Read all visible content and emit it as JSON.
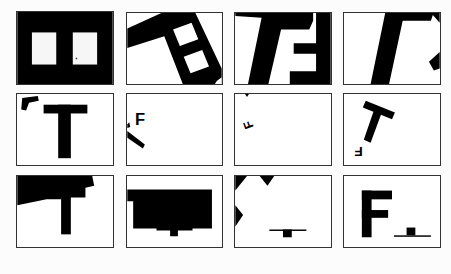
{
  "figure": {
    "layout": {
      "rows": 3,
      "cols": 4
    },
    "colors": {
      "ink": "#000000",
      "paper": "#ffffff",
      "border": "#333333"
    },
    "panels": [
      {
        "id": "r1c1",
        "description": "black field with two white square windows"
      },
      {
        "id": "r1c2",
        "description": "rotated black frame with two white squares"
      },
      {
        "id": "r1c3",
        "description": "slanted T merged with E-like shape"
      },
      {
        "id": "r1c4",
        "description": "slanted bar with partial shapes at right edge"
      },
      {
        "id": "r2c1",
        "description": "large T with small rotated F-fragment at top-left",
        "letters": [
          "T"
        ]
      },
      {
        "id": "r2c2",
        "description": "small F with diagonal bar at left edge",
        "letters": [
          "F"
        ]
      },
      {
        "id": "r2c3",
        "description": "small rotated F near left edge",
        "letters": [
          "F"
        ]
      },
      {
        "id": "r2c4",
        "description": "tilted T with small inverted F below-left",
        "letters": [
          "T",
          "F"
        ]
      },
      {
        "id": "r3c1",
        "description": "T with enlarged black top region",
        "letters": [
          "T"
        ]
      },
      {
        "id": "r3c2",
        "description": "large black rectangle with small stem below"
      },
      {
        "id": "r3c3",
        "description": "black corner wedges with small horizontal line and block at bottom"
      },
      {
        "id": "r3c4",
        "description": "large F with small horizontal line and block at bottom-right",
        "letters": [
          "F"
        ]
      }
    ]
  }
}
